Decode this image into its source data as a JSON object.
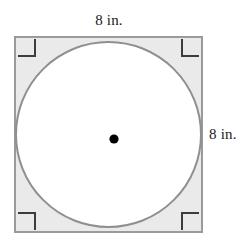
{
  "figure": {
    "labels": {
      "top": "8 in.",
      "right": "8 in."
    },
    "colors": {
      "square_fill": "#eaeaea",
      "square_stroke": "#9a9a9a",
      "circle_fill": "#ffffff",
      "circle_stroke": "#8f8f8f",
      "center_dot": "#000000",
      "right_angle_mark": "#3c3c3c",
      "background": "#ffffff"
    },
    "square": {
      "x": 14,
      "y": 36,
      "width": 189,
      "height": 197,
      "stroke_width": 2,
      "side_length_value": "8 in."
    },
    "circle": {
      "cx": 108.5,
      "cy": 134.5,
      "r": 93.5,
      "stroke_width": 2,
      "inscribed": "true"
    },
    "center_dot": {
      "cx": 114,
      "cy": 139,
      "r": 4.5
    },
    "right_angle_marks": [
      {
        "name": "top-left",
        "x": 18,
        "y": 40,
        "size": 16,
        "dx": 1,
        "dy": 1
      },
      {
        "name": "top-right",
        "x": 183,
        "y": 40,
        "size": 16,
        "dx": -1,
        "dy": 1
      },
      {
        "name": "bottom-left",
        "x": 18,
        "y": 213,
        "size": 16,
        "dx": 1,
        "dy": -1
      },
      {
        "name": "bottom-right",
        "x": 183,
        "y": 213,
        "size": 16,
        "dx": -1,
        "dy": -1
      }
    ]
  }
}
